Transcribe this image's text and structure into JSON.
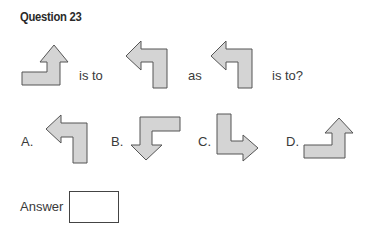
{
  "question": {
    "title": "Question 23",
    "stem": {
      "is_to_1": "is to",
      "as": "as",
      "is_to_2": "is to?"
    },
    "figures": [
      {
        "id": "given-1",
        "direction": "up",
        "tail": "left"
      },
      {
        "id": "given-2",
        "direction": "left",
        "tail": "down"
      },
      {
        "id": "given-3",
        "direction": "left",
        "tail": "down"
      }
    ],
    "options": [
      {
        "label": "A.",
        "direction": "left",
        "tail": "down"
      },
      {
        "label": "B.",
        "direction": "down",
        "tail": "right"
      },
      {
        "label": "C.",
        "direction": "right",
        "tail": "up"
      },
      {
        "label": "D.",
        "direction": "up",
        "tail": "left"
      }
    ],
    "answer_label": "Answer",
    "answer_value": ""
  },
  "colors": {
    "arrow_fill": "#d4d4d4",
    "arrow_stroke": "#555555",
    "text": "#333333"
  }
}
